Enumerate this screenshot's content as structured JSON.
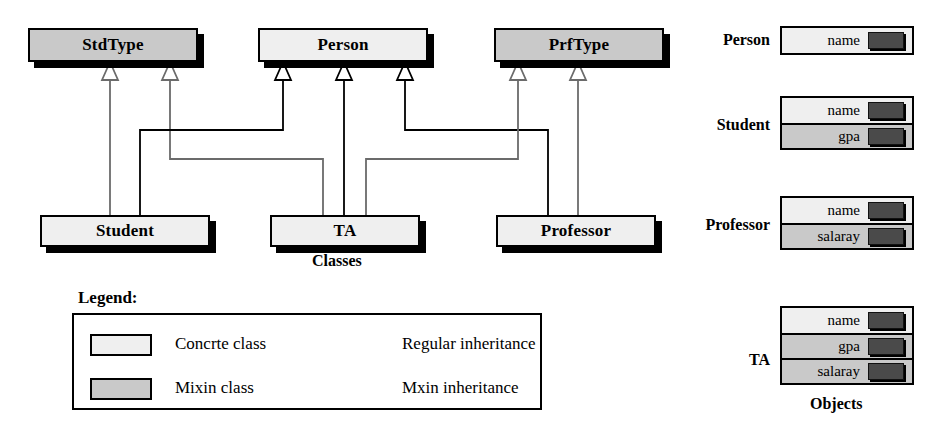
{
  "diagram": {
    "classes_caption": "Classes",
    "objects_caption": "Objects",
    "mixin_classes": [
      {
        "name": "StdType"
      },
      {
        "name": "PrfType"
      }
    ],
    "base_classes": [
      {
        "name": "Person"
      }
    ],
    "concrete_classes": [
      {
        "name": "Student"
      },
      {
        "name": "TA"
      },
      {
        "name": "Professor"
      }
    ]
  },
  "objects": [
    {
      "label": "Person",
      "slots": [
        {
          "name": "name",
          "kind": "concrete"
        }
      ]
    },
    {
      "label": "Student",
      "slots": [
        {
          "name": "name",
          "kind": "concrete"
        },
        {
          "name": "gpa",
          "kind": "mixin"
        }
      ]
    },
    {
      "label": "Professor",
      "slots": [
        {
          "name": "name",
          "kind": "concrete"
        },
        {
          "name": "salaray",
          "kind": "mixin"
        }
      ]
    },
    {
      "label": "TA",
      "slots": [
        {
          "name": "name",
          "kind": "concrete"
        },
        {
          "name": "gpa",
          "kind": "mixin"
        },
        {
          "name": "salaray",
          "kind": "mixin"
        }
      ]
    }
  ],
  "legend": {
    "title": "Legend:",
    "entries": [
      {
        "swatch": "concrete",
        "label": "Concrte class"
      },
      {
        "swatch": "mixin",
        "label": "Mixin class"
      }
    ],
    "arrows": [
      {
        "style": "regular",
        "label": "Regular inheritance"
      },
      {
        "style": "mixin",
        "label": "Mxin inheritance"
      }
    ]
  },
  "colors": {
    "mixin_fill": "#c9c9c9",
    "concrete_fill": "#efefef",
    "line_black": "#000000",
    "line_gray": "#6b6b6b",
    "value_chip": "#4a4a4a"
  }
}
